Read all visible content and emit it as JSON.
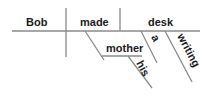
{
  "diagram": {
    "type": "sentence-diagram",
    "sentence_words": {
      "subject": "Bob",
      "verb": "made",
      "direct_object": "desk",
      "indirect_object": "mother",
      "indirect_object_modifier": "his",
      "object_article": "a",
      "object_modifier": "writing"
    },
    "colors": {
      "line": "#8a8a8a",
      "text": "#1a1a1a",
      "background": "#ffffff"
    }
  }
}
